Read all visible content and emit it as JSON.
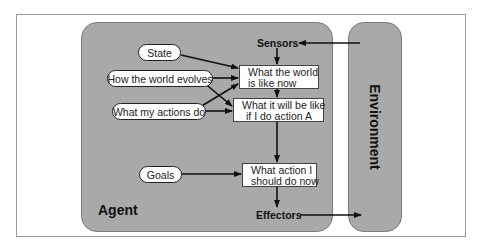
{
  "diagram": {
    "title": "",
    "agent": {
      "label": "Agent"
    },
    "environment": {
      "label": "Environment"
    },
    "sensors": {
      "label": "Sensors"
    },
    "effectors": {
      "label": "Effectors"
    },
    "inputs": [
      {
        "id": "state",
        "label": "State"
      },
      {
        "id": "how_world_evolves",
        "label": "How the world evolves"
      },
      {
        "id": "what_my_actions_do",
        "label": "What my actions do"
      },
      {
        "id": "goals",
        "label": "Goals"
      }
    ],
    "boxes": [
      {
        "id": "world_now",
        "line1": "What the world",
        "line2": "is like now"
      },
      {
        "id": "world_if_action",
        "line1": "What it will be like",
        "line2": "if I do action A"
      },
      {
        "id": "action_choice",
        "line1": "What action I",
        "line2": "should do now"
      }
    ],
    "edges": [
      {
        "from": "environment",
        "to": "sensors"
      },
      {
        "from": "sensors",
        "to": "world_now"
      },
      {
        "from": "state",
        "to": "world_now"
      },
      {
        "from": "how_world_evolves",
        "to": "world_now"
      },
      {
        "from": "how_world_evolves",
        "to": "world_if_action"
      },
      {
        "from": "what_my_actions_do",
        "to": "world_now"
      },
      {
        "from": "what_my_actions_do",
        "to": "world_if_action"
      },
      {
        "from": "world_now",
        "to": "world_if_action"
      },
      {
        "from": "world_if_action",
        "to": "action_choice"
      },
      {
        "from": "goals",
        "to": "action_choice"
      },
      {
        "from": "action_choice",
        "to": "effectors"
      },
      {
        "from": "effectors",
        "to": "environment"
      }
    ],
    "colors": {
      "panel": "#a9a9a9",
      "node": "#ffffff",
      "line": "#111111"
    }
  }
}
